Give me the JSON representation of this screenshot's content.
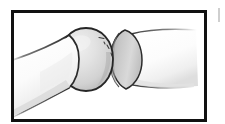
{
  "figure": {
    "caption": "",
    "medium": "pencil and ink line drawing",
    "background_color": "#ffffff",
    "frame": {
      "name": "illustration-border",
      "color": "#111111",
      "stroke_width": 3,
      "x": 11,
      "y": 10,
      "width": 196,
      "height": 112
    },
    "margin_mark": {
      "name": "page-edge-mark",
      "color": "#cfcfcf",
      "x": 218,
      "y": 8,
      "width": 2,
      "height": 14
    },
    "ink_color": "#262626",
    "shade_light": "#f2f2f2",
    "shade_mid": "#d8d8d8",
    "shade_dark": "#b5b5b5",
    "parts": [
      {
        "name": "proximal-bone-shaft",
        "label": "Left bone shaft",
        "description": "Tapered cylindrical bone entering from lower-left edge, angled upward to the right",
        "fill": "#f6f6f6",
        "outline": "#2a2a2a"
      },
      {
        "name": "joint-ball-head",
        "label": "Ball (head of bone)",
        "description": "Spherical articular head at centre with graded grey shading and fine stipple marks",
        "fill": "#dcdcdc",
        "outline": "#2a2a2a"
      },
      {
        "name": "joint-socket-cup",
        "label": "Socket (cup)",
        "description": "Crescent shaped concave socket cupping the right side of the ball",
        "fill": "#cdcdcd",
        "outline": "#2a2a2a"
      },
      {
        "name": "distal-bone-shaft",
        "label": "Right bone shaft",
        "description": "Cylindrical bone extending right from the socket, outline fading toward the right",
        "fill": "#fafafa",
        "outline": "#3a3a3a"
      }
    ],
    "detail_marks": [
      {
        "name": "stipple-mark-1",
        "x": 104,
        "y": 39
      },
      {
        "name": "stipple-mark-2",
        "x": 110,
        "y": 46
      },
      {
        "name": "stipple-mark-3",
        "x": 113,
        "y": 54
      },
      {
        "name": "stipple-mark-4",
        "x": 118,
        "y": 58
      }
    ]
  }
}
